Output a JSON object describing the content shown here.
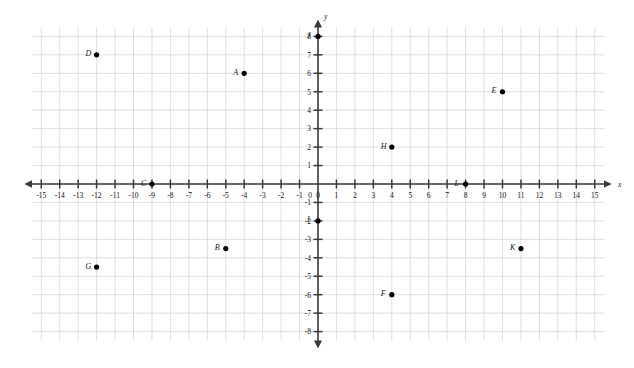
{
  "chart_data": {
    "type": "scatter",
    "title": "",
    "xlabel": "x",
    "ylabel": "y",
    "xlim": [
      -15.5,
      15.5
    ],
    "ylim": [
      -8.5,
      8.5
    ],
    "grid": true,
    "grid_step": 1,
    "legend": "none",
    "x_tick_labels": [
      "-15",
      "-14",
      "-13",
      "-12",
      "-11",
      "-10",
      "-9",
      "-8",
      "-7",
      "-6",
      "-5",
      "-4",
      "-3",
      "-2",
      "-1",
      "0",
      "1",
      "2",
      "3",
      "4",
      "5",
      "6",
      "7",
      "8",
      "9",
      "10",
      "11",
      "12",
      "13",
      "14",
      "15"
    ],
    "y_tick_labels": [
      "8",
      "7",
      "6",
      "5",
      "4",
      "3",
      "2",
      "1",
      "-1",
      "-2",
      "-3",
      "-4",
      "-5",
      "-6",
      "-7",
      "-8"
    ],
    "points": [
      {
        "label": "A",
        "x": -4,
        "y": 6
      },
      {
        "label": "B",
        "x": -5,
        "y": -3.5
      },
      {
        "label": "C",
        "x": -9,
        "y": 0
      },
      {
        "label": "D",
        "x": -12,
        "y": 7
      },
      {
        "label": "E",
        "x": 10,
        "y": 5
      },
      {
        "label": "F",
        "x": 4,
        "y": -6
      },
      {
        "label": "G",
        "x": -12,
        "y": -4.5
      },
      {
        "label": "H",
        "x": 4,
        "y": 2
      },
      {
        "label": "I",
        "x": 0,
        "y": -2
      },
      {
        "label": "J",
        "x": 0,
        "y": 8
      },
      {
        "label": "K",
        "x": 11,
        "y": -3.5
      },
      {
        "label": "L",
        "x": 8,
        "y": 0
      }
    ]
  },
  "colors": {
    "background": "#ffffff",
    "grid": "#d3d3d9",
    "axis": "#3a3a3a",
    "point": "#000000",
    "label": "#1a1a1a"
  }
}
